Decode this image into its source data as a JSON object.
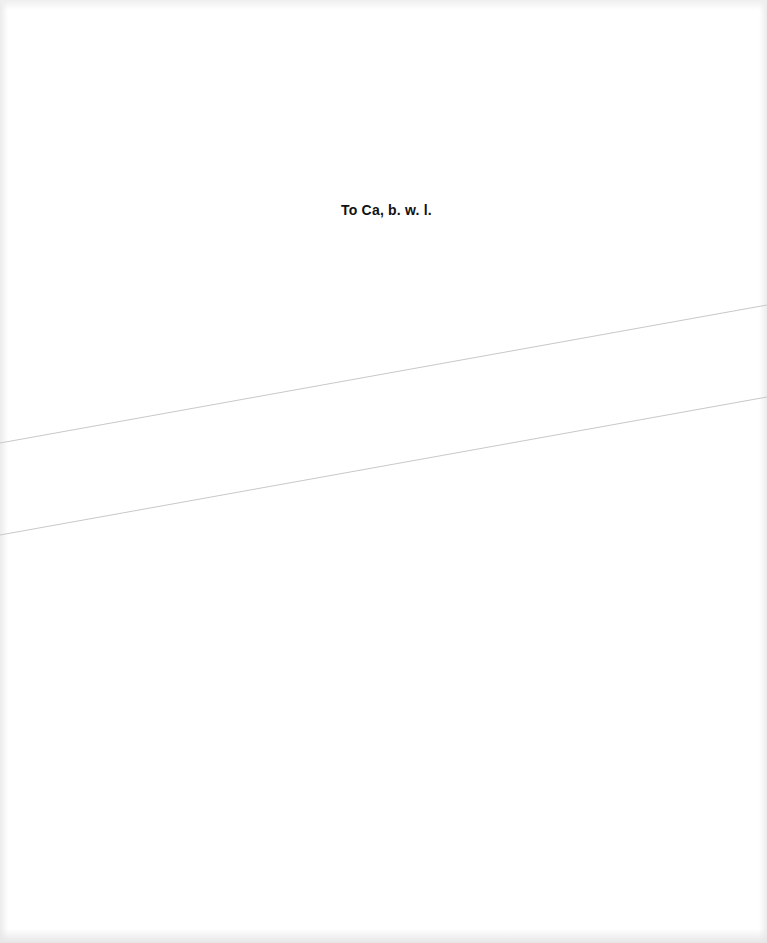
{
  "page": {
    "dedication_text": "To Ca, b. w. l.",
    "background_color": "#ffffff",
    "text_color": "#111111",
    "line_color": "#c8c8c8"
  },
  "lines": [
    {
      "x1": 0,
      "y1": 443,
      "x2": 767,
      "y2": 305
    },
    {
      "x1": 0,
      "y1": 535,
      "x2": 767,
      "y2": 397
    }
  ]
}
